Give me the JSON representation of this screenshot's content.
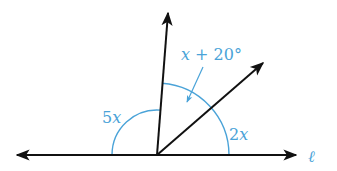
{
  "diagram": {
    "type": "geometry-angles-on-a-line",
    "colors": {
      "line": "#111111",
      "annotation": "#4aa3d8",
      "background": "#ffffff"
    },
    "vertex": [
      157,
      155
    ],
    "line_label": "ℓ",
    "rays": [
      {
        "name": "left-ray",
        "to": [
          17,
          155
        ]
      },
      {
        "name": "right-ray",
        "to": [
          296,
          155
        ]
      },
      {
        "name": "upper-ray",
        "to": [
          168,
          12
        ]
      },
      {
        "name": "diagonal-ray",
        "to": [
          264,
          62
        ]
      }
    ],
    "angles": [
      {
        "label": "5x",
        "between": [
          "left-ray",
          "upper-ray"
        ]
      },
      {
        "label": "x + 20°",
        "between": [
          "upper-ray",
          "diagonal-ray"
        ]
      },
      {
        "label": "2x",
        "between": [
          "diagonal-ray",
          "right-ray"
        ]
      }
    ],
    "labels": {
      "angle_left": "5x",
      "angle_left_num": "5",
      "angle_left_var": "x",
      "angle_middle_var": "x",
      "angle_middle_rest": " + 20°",
      "angle_right_num": "2",
      "angle_right_var": "x",
      "line": "ℓ"
    }
  }
}
